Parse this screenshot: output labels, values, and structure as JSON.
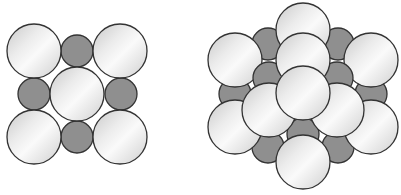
{
  "figure": {
    "colors": {
      "large_atom_light": "#f4f4f4",
      "large_atom_mid": "#d6d6d6",
      "small_atom": "#8f8f8f",
      "outline": "#333333",
      "background": "#ffffff"
    },
    "panels": [
      {
        "name": "square-packing",
        "large_atoms": 5,
        "small_atoms": 4
      },
      {
        "name": "hexagonal-packing",
        "large_atoms": 10,
        "small_atoms": 12
      }
    ]
  }
}
